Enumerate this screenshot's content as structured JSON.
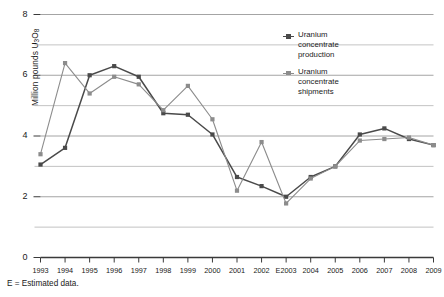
{
  "chart_data": {
    "type": "line",
    "title": "",
    "subtitle": "",
    "xlabel": "",
    "ylabel": "Million pounds U3O8",
    "ylabel_parts": {
      "pre": "Million pounds U",
      "sub1": "3",
      "mid": "O",
      "sub2": "8"
    },
    "categories": [
      "1993",
      "1994",
      "1995",
      "1996",
      "1997",
      "1998",
      "1999",
      "2000",
      "2001",
      "2002",
      "E2003",
      "2004",
      "2005",
      "2006",
      "2007",
      "2008",
      "2009"
    ],
    "xlim": [
      1993,
      2009
    ],
    "ylim": [
      0,
      8
    ],
    "yticks": [
      0,
      2,
      4,
      6,
      8
    ],
    "ytick_labels": [
      "0",
      "2",
      "4",
      "6",
      "8"
    ],
    "yminor": [
      1,
      3,
      5,
      7
    ],
    "grid": true,
    "legend_position": "inside-top-right",
    "series": [
      {
        "name": "Uranium concentrate production",
        "legend_label": "Uranium\nconcentrate\nproduction",
        "color": "#4a4a4a",
        "marker": "square",
        "values": [
          3.06,
          3.61,
          6.0,
          6.3,
          5.95,
          4.75,
          4.7,
          4.05,
          2.65,
          2.35,
          2.0,
          2.65,
          3.0,
          4.05,
          4.25,
          3.9,
          3.7
        ]
      },
      {
        "name": "Uranium concentrate shipments",
        "legend_label": "Uranium\nconcentrate\nshipments",
        "color": "#8c8c8c",
        "marker": "square",
        "values": [
          3.4,
          6.4,
          5.4,
          5.95,
          5.7,
          4.85,
          5.65,
          4.55,
          2.2,
          3.8,
          1.78,
          2.6,
          3.0,
          3.85,
          3.9,
          3.95,
          3.7
        ]
      }
    ],
    "footnote": "E = Estimated data."
  },
  "colors": {
    "axis": "#3a3a3a",
    "grid_major": "#9a9a9a",
    "grid_minor": "#b4b4b4",
    "text": "#1a1a1a",
    "production": "#4a4a4a",
    "shipments": "#8c8c8c"
  }
}
